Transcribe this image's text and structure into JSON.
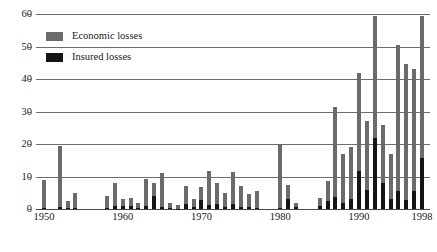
{
  "chart_data": {
    "type": "bar",
    "title": "",
    "subtitle": "",
    "xlabel": "",
    "ylabel": "",
    "ylim": [
      0,
      60
    ],
    "yticks": [
      0,
      10,
      20,
      30,
      40,
      50,
      60
    ],
    "ytick_labels": [
      "0",
      "10",
      "20",
      "30",
      "40",
      "50",
      "60"
    ],
    "xtick_labels": [
      "1950",
      "1960",
      "1970",
      "1980",
      "1990",
      "1998"
    ],
    "xticks": [
      1950,
      1960,
      1970,
      1980,
      1990,
      1998
    ],
    "xlim": [
      1949,
      1999
    ],
    "grid": true,
    "legend_position": "upper-left-inside",
    "bar_overlay": "insured losses drawn in front of economic losses, sharing the same baseline",
    "x": [
      1950,
      1951,
      1952,
      1953,
      1954,
      1955,
      1956,
      1957,
      1958,
      1959,
      1960,
      1961,
      1962,
      1963,
      1964,
      1965,
      1966,
      1967,
      1968,
      1969,
      1970,
      1971,
      1972,
      1973,
      1974,
      1975,
      1976,
      1977,
      1978,
      1979,
      1980,
      1981,
      1982,
      1983,
      1984,
      1985,
      1986,
      1987,
      1988,
      1989,
      1990,
      1991,
      1992,
      1993,
      1994,
      1995,
      1996,
      1997,
      1998
    ],
    "series": [
      {
        "name": "Economic losses",
        "color": "#6b6b6b",
        "values": [
          9,
          0,
          19.5,
          2.5,
          5,
          0,
          0,
          0,
          4,
          8,
          3,
          3.5,
          1.8,
          9.3,
          8,
          11,
          2,
          1.3,
          7,
          3,
          6.7,
          11.7,
          8,
          4.8,
          11.5,
          7,
          4.5,
          5.5,
          0,
          0,
          20,
          7.5,
          2,
          0,
          0,
          3.3,
          8.5,
          31.5,
          17,
          19,
          41.8,
          27,
          59.5,
          26,
          17,
          50.5,
          44.5,
          43,
          59.5
        ]
      },
      {
        "name": "Insured losses",
        "color": "#151515",
        "values": [
          0.3,
          0,
          0.6,
          0.2,
          0.3,
          0,
          0,
          0,
          0.4,
          0.8,
          1.0,
          0.9,
          0.3,
          1.0,
          3.9,
          0.5,
          0.2,
          0.1,
          1.6,
          0.5,
          2.8,
          1.1,
          1.5,
          0.5,
          1.4,
          0.7,
          0.5,
          0.4,
          0,
          0,
          0.4,
          3.2,
          0.7,
          0,
          0,
          1.0,
          2.5,
          3.7,
          1.7,
          3.0,
          11.8,
          6.0,
          22.0,
          8.0,
          3.0,
          5.5,
          2.7,
          5.5,
          15.8
        ]
      }
    ]
  },
  "legend": {
    "items": [
      {
        "label": "Economic losses",
        "color": "#6b6b6b",
        "swatch": "economic-losses-swatch"
      },
      {
        "label": "Insured losses",
        "color": "#151515",
        "swatch": "insured-losses-swatch"
      }
    ]
  },
  "colors": {
    "economic": "#6b6b6b",
    "insured": "#151515",
    "gridline": "#6e6e6e",
    "axis": "#4a4a4a",
    "text": "#1a1a1a",
    "background": "#ffffff"
  }
}
